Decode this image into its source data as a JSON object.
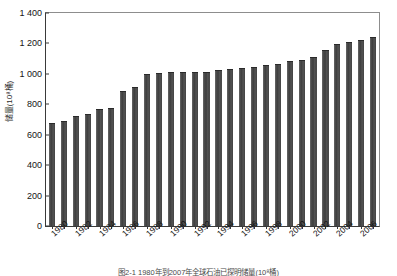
{
  "chart_data": {
    "type": "bar",
    "title": "",
    "xlabel": "",
    "ylabel": "储量(10⁸桶)",
    "ylim": [
      0,
      1400
    ],
    "yticks": [
      0,
      200,
      400,
      600,
      800,
      1000,
      1200,
      1400
    ],
    "ytick_labels": [
      "0",
      "200",
      "400",
      "600",
      "800",
      "1 000",
      "1 200",
      "1 400"
    ],
    "grid": false,
    "legend": false,
    "bar_color": "#4a4a4a",
    "categories": [
      "1980",
      "1981",
      "1982",
      "1983",
      "1984",
      "1985",
      "1986",
      "1987",
      "1988",
      "1989",
      "1990",
      "1991",
      "1992",
      "1993",
      "1994",
      "1995",
      "1996",
      "1997",
      "1998",
      "1999",
      "2000",
      "2001",
      "2002",
      "2003",
      "2004",
      "2005",
      "2006",
      "2007"
    ],
    "values": [
      668,
      683,
      716,
      728,
      760,
      772,
      878,
      910,
      995,
      1000,
      1003,
      1005,
      1008,
      1008,
      1018,
      1023,
      1033,
      1041,
      1052,
      1060,
      1075,
      1083,
      1105,
      1148,
      1188,
      1204,
      1218,
      1238
    ],
    "xtick_labels": [
      "1980",
      "1982",
      "1984",
      "1986",
      "1988",
      "1990",
      "1992",
      "1994",
      "1996",
      "1998",
      "2000",
      "2002",
      "2004",
      "2006"
    ],
    "caption": "图2-1  1980年到2007年全球石油已探明储量(10⁸桶)"
  }
}
